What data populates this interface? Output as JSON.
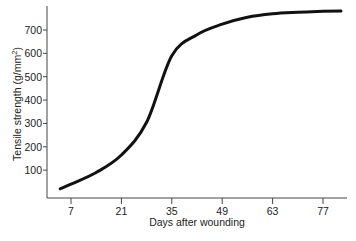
{
  "chart_data": {
    "type": "line",
    "title": "",
    "xlabel": "Days after wounding",
    "ylabel": "Tensile strength (g/mm",
    "ylabel_superscript": "2",
    "ylabel_suffix": ")",
    "x_ticks": [
      7,
      21,
      35,
      49,
      63,
      77
    ],
    "y_ticks": [
      100,
      200,
      300,
      400,
      500,
      600,
      700
    ],
    "xlim": [
      0,
      87
    ],
    "ylim": [
      0,
      800
    ],
    "grid": false,
    "legend": null,
    "series": [
      {
        "name": "Tensile strength",
        "color": "#111111",
        "x": [
          4,
          7,
          14,
          21,
          28,
          35,
          42,
          49,
          56,
          63,
          70,
          77,
          82
        ],
        "y": [
          20,
          40,
          90,
          165,
          305,
          590,
          680,
          725,
          755,
          770,
          776,
          780,
          781
        ]
      }
    ]
  }
}
